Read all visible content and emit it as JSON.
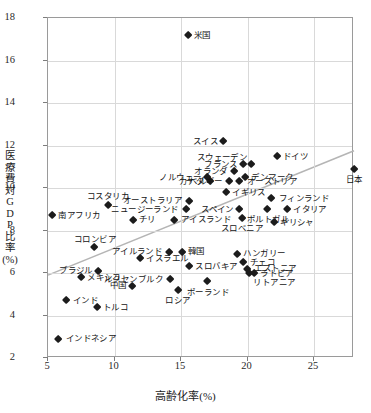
{
  "chart_data": {
    "type": "scatter",
    "title": "",
    "xlabel": "高齢化率(%)",
    "ylabel": "医療費対GDP比率(%)",
    "ylabel_chars": [
      "医",
      "療",
      "費",
      "対",
      "G",
      "D",
      "P",
      "比",
      "率",
      "(%)"
    ],
    "xlim": [
      5,
      28
    ],
    "ylim": [
      2,
      18
    ],
    "xticks": [
      5,
      10,
      15,
      20,
      25
    ],
    "yticks": [
      2,
      4,
      6,
      8,
      10,
      12,
      14,
      16,
      18
    ],
    "grid": true,
    "legend": "none",
    "marker": "filled-diamond",
    "marker_color": "#1c1c1c",
    "trendline": {
      "visible": true,
      "color": "#b5b5b5",
      "x_start": 5.0,
      "y_start": 5.9,
      "x_end": 28.0,
      "y_end": 11.75
    },
    "points": [
      {
        "name": "米国",
        "x": 15.5,
        "y": 17.2,
        "label_pos": "lbl-r"
      },
      {
        "name": "スイス",
        "x": 18.2,
        "y": 12.2,
        "label_pos": "lbl-l"
      },
      {
        "name": "ドイツ",
        "x": 22.2,
        "y": 11.5,
        "label_pos": "lbl-r"
      },
      {
        "name": "スウェーデン",
        "x": 20.3,
        "y": 11.1,
        "label_pos": "lbl-tl"
      },
      {
        "name": "フランス",
        "x": 19.7,
        "y": 11.1,
        "label_pos": "lbl-l"
      },
      {
        "name": "オランダ",
        "x": 19.0,
        "y": 10.8,
        "label_pos": "lbl-l"
      },
      {
        "name": "デンマーク",
        "x": 19.8,
        "y": 10.5,
        "label_pos": "lbl-r"
      },
      {
        "name": "オーストリア",
        "x": 19.4,
        "y": 10.3,
        "label_pos": "lbl-r"
      },
      {
        "name": "ノルウェー",
        "x": 17.0,
        "y": 10.5,
        "label_pos": "lbl-l"
      },
      {
        "name": "カナダ",
        "x": 17.2,
        "y": 10.3,
        "label_pos": "lbl-l"
      },
      {
        "name": "ベルギー",
        "x": 18.6,
        "y": 10.3,
        "label_pos": "lbl-l"
      },
      {
        "name": "日本",
        "x": 28.0,
        "y": 10.9,
        "label_pos": "lbl-b"
      },
      {
        "name": "イギリス",
        "x": 18.4,
        "y": 9.8,
        "label_pos": "lbl-r"
      },
      {
        "name": "フィンランド",
        "x": 21.8,
        "y": 9.5,
        "label_pos": "lbl-r"
      },
      {
        "name": "イタリア",
        "x": 23.0,
        "y": 9.0,
        "label_pos": "lbl-r"
      },
      {
        "name": "ポルトガル",
        "x": 21.5,
        "y": 9.0,
        "label_pos": "lbl-b"
      },
      {
        "name": "ギリシャ",
        "x": 22.0,
        "y": 8.4,
        "label_pos": "lbl-r"
      },
      {
        "name": "スペイン",
        "x": 19.4,
        "y": 9.0,
        "label_pos": "lbl-l"
      },
      {
        "name": "スロベニア",
        "x": 19.6,
        "y": 8.6,
        "label_pos": "lbl-b"
      },
      {
        "name": "オーストラリア",
        "x": 15.6,
        "y": 9.4,
        "label_pos": "lbl-l"
      },
      {
        "name": "ニュージーランド",
        "x": 15.4,
        "y": 9.0,
        "label_pos": "lbl-l"
      },
      {
        "name": "コスタリカ",
        "x": 9.5,
        "y": 9.2,
        "label_pos": "lbl-t"
      },
      {
        "name": "南アフリカ",
        "x": 5.3,
        "y": 8.7,
        "label_pos": "lbl-r"
      },
      {
        "name": "アイスランド",
        "x": 14.5,
        "y": 8.5,
        "label_pos": "lbl-r"
      },
      {
        "name": "チリ",
        "x": 11.4,
        "y": 8.5,
        "label_pos": "lbl-r"
      },
      {
        "name": "コロンビア",
        "x": 8.5,
        "y": 7.2,
        "label_pos": "lbl-t"
      },
      {
        "name": "アイルランド",
        "x": 14.1,
        "y": 7.0,
        "label_pos": "lbl-l"
      },
      {
        "name": "韓国",
        "x": 15.1,
        "y": 7.0,
        "label_pos": "lbl-r"
      },
      {
        "name": "イスラエル",
        "x": 11.9,
        "y": 6.7,
        "label_pos": "lbl-r"
      },
      {
        "name": "ハンガリー",
        "x": 19.2,
        "y": 6.9,
        "label_pos": "lbl-r"
      },
      {
        "name": "チェコ",
        "x": 19.7,
        "y": 6.5,
        "label_pos": "lbl-r"
      },
      {
        "name": "エストニア",
        "x": 20.0,
        "y": 6.2,
        "label_pos": "lbl-r"
      },
      {
        "name": "リトアニア",
        "x": 20.1,
        "y": 6.0,
        "label_pos": "lbl-br"
      },
      {
        "name": "スロバキア",
        "x": 15.6,
        "y": 6.3,
        "label_pos": "lbl-r"
      },
      {
        "name": "ブラジル",
        "x": 8.8,
        "y": 6.1,
        "label_pos": "lbl-l"
      },
      {
        "name": "メキシコ",
        "x": 7.5,
        "y": 5.8,
        "label_pos": "lbl-r"
      },
      {
        "name": "ルクセンブルク",
        "x": 14.2,
        "y": 5.7,
        "label_pos": "lbl-l"
      },
      {
        "name": "ポーランド",
        "x": 17.0,
        "y": 5.6,
        "label_pos": "lbl-b"
      },
      {
        "name": "中国",
        "x": 11.3,
        "y": 5.4,
        "label_pos": "lbl-l"
      },
      {
        "name": "ロシア",
        "x": 14.8,
        "y": 5.2,
        "label_pos": "lbl-b"
      },
      {
        "name": "ラトビア",
        "x": 20.5,
        "y": 6.0,
        "label_pos": "lbl-r"
      },
      {
        "name": "インド",
        "x": 6.4,
        "y": 4.7,
        "label_pos": "lbl-r"
      },
      {
        "name": "トルコ",
        "x": 8.7,
        "y": 4.4,
        "label_pos": "lbl-r"
      },
      {
        "name": "インドネシア",
        "x": 5.8,
        "y": 2.9,
        "label_pos": "lbl-r"
      }
    ]
  }
}
